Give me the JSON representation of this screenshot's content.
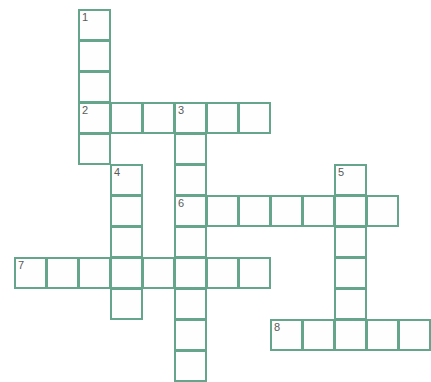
{
  "puzzle": {
    "kind": "crossword-grid",
    "title": "",
    "background_color": "#ffffff",
    "cell_fill_color": "#fdfefd",
    "cell_border_color": "#65a58c",
    "number_color": "#5a5a5a",
    "cell_size": 32,
    "origin_x": 14,
    "origin_y": 9,
    "columns": 13,
    "rows": 12,
    "total_cells": 41,
    "numbered_cells": 8
  },
  "entries": [
    {
      "number": "1",
      "direction": "down",
      "length": 4,
      "start_col": 2,
      "start_row": 0,
      "label": "1-down"
    },
    {
      "number": "2",
      "direction": "across",
      "length": 6,
      "start_col": 2,
      "start_row": 3,
      "label": "2-across"
    },
    {
      "number": "3",
      "direction": "down",
      "length": 9,
      "start_col": 5,
      "start_row": 3,
      "label": "3-down"
    },
    {
      "number": "4",
      "direction": "down",
      "length": 6,
      "start_col": 3,
      "start_row": 5,
      "label": "4-down"
    },
    {
      "number": "5",
      "direction": "down",
      "length": 6,
      "start_col": 10,
      "start_row": 5,
      "label": "5-down"
    },
    {
      "number": "6",
      "direction": "across",
      "length": 7,
      "start_col": 5,
      "start_row": 6,
      "label": "6-across"
    },
    {
      "number": "7",
      "direction": "across",
      "length": 8,
      "start_col": 0,
      "start_row": 8,
      "label": "7-across"
    },
    {
      "number": "8",
      "direction": "across",
      "length": 5,
      "start_col": 8,
      "start_row": 10,
      "label": "8-across"
    }
  ],
  "cells": [
    {
      "col": 2,
      "row": 0,
      "number": "1",
      "letter": ""
    },
    {
      "col": 2,
      "row": 1,
      "number": "",
      "letter": ""
    },
    {
      "col": 2,
      "row": 2,
      "number": "",
      "letter": ""
    },
    {
      "col": 2,
      "row": 3,
      "number": "2",
      "letter": ""
    },
    {
      "col": 3,
      "row": 3,
      "number": "",
      "letter": ""
    },
    {
      "col": 4,
      "row": 3,
      "number": "",
      "letter": ""
    },
    {
      "col": 5,
      "row": 3,
      "number": "3",
      "letter": ""
    },
    {
      "col": 6,
      "row": 3,
      "number": "",
      "letter": ""
    },
    {
      "col": 7,
      "row": 3,
      "number": "",
      "letter": ""
    },
    {
      "col": 2,
      "row": 4,
      "number": "",
      "letter": ""
    },
    {
      "col": 5,
      "row": 4,
      "number": "",
      "letter": ""
    },
    {
      "col": 5,
      "row": 5,
      "number": "",
      "letter": ""
    },
    {
      "col": 3,
      "row": 5,
      "number": "4",
      "letter": ""
    },
    {
      "col": 10,
      "row": 5,
      "number": "5",
      "letter": ""
    },
    {
      "col": 3,
      "row": 6,
      "number": "",
      "letter": ""
    },
    {
      "col": 5,
      "row": 6,
      "number": "6",
      "letter": ""
    },
    {
      "col": 6,
      "row": 6,
      "number": "",
      "letter": ""
    },
    {
      "col": 7,
      "row": 6,
      "number": "",
      "letter": ""
    },
    {
      "col": 8,
      "row": 6,
      "number": "",
      "letter": ""
    },
    {
      "col": 9,
      "row": 6,
      "number": "",
      "letter": ""
    },
    {
      "col": 10,
      "row": 6,
      "number": "",
      "letter": ""
    },
    {
      "col": 11,
      "row": 6,
      "number": "",
      "letter": ""
    },
    {
      "col": 3,
      "row": 7,
      "number": "",
      "letter": ""
    },
    {
      "col": 5,
      "row": 7,
      "number": "",
      "letter": ""
    },
    {
      "col": 10,
      "row": 7,
      "number": "",
      "letter": ""
    },
    {
      "col": 0,
      "row": 8,
      "number": "7",
      "letter": ""
    },
    {
      "col": 1,
      "row": 8,
      "number": "",
      "letter": ""
    },
    {
      "col": 2,
      "row": 8,
      "number": "",
      "letter": ""
    },
    {
      "col": 3,
      "row": 8,
      "number": "",
      "letter": ""
    },
    {
      "col": 4,
      "row": 8,
      "number": "",
      "letter": ""
    },
    {
      "col": 5,
      "row": 8,
      "number": "",
      "letter": ""
    },
    {
      "col": 6,
      "row": 8,
      "number": "",
      "letter": ""
    },
    {
      "col": 7,
      "row": 8,
      "number": "",
      "letter": ""
    },
    {
      "col": 10,
      "row": 8,
      "number": "",
      "letter": ""
    },
    {
      "col": 3,
      "row": 9,
      "number": "",
      "letter": ""
    },
    {
      "col": 5,
      "row": 9,
      "number": "",
      "letter": ""
    },
    {
      "col": 10,
      "row": 9,
      "number": "",
      "letter": ""
    },
    {
      "col": 5,
      "row": 10,
      "number": "",
      "letter": ""
    },
    {
      "col": 8,
      "row": 10,
      "number": "8",
      "letter": ""
    },
    {
      "col": 9,
      "row": 10,
      "number": "",
      "letter": ""
    },
    {
      "col": 10,
      "row": 10,
      "number": "",
      "letter": ""
    },
    {
      "col": 11,
      "row": 10,
      "number": "",
      "letter": ""
    },
    {
      "col": 12,
      "row": 10,
      "number": "",
      "letter": ""
    },
    {
      "col": 5,
      "row": 11,
      "number": "",
      "letter": ""
    }
  ]
}
